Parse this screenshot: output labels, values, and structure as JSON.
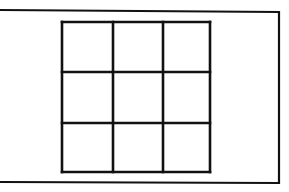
{
  "diagram": {
    "type": "grid-in-frame",
    "background": "#ffffff",
    "stroke_color": "#111111",
    "outer_frame": {
      "points": [
        [
          -2,
          10
        ],
        [
          279,
          12
        ],
        [
          279,
          183
        ],
        [
          -2,
          182
        ]
      ],
      "stroke_width": 2.2
    },
    "grid": {
      "rows": 3,
      "cols": 3,
      "left": 62,
      "top": 22,
      "right": 210,
      "bottom": 172,
      "vertical_lines": [
        62,
        113,
        163,
        210
      ],
      "horizontal_lines": [
        22,
        72,
        123,
        172
      ],
      "stroke_width": 2.6
    }
  }
}
